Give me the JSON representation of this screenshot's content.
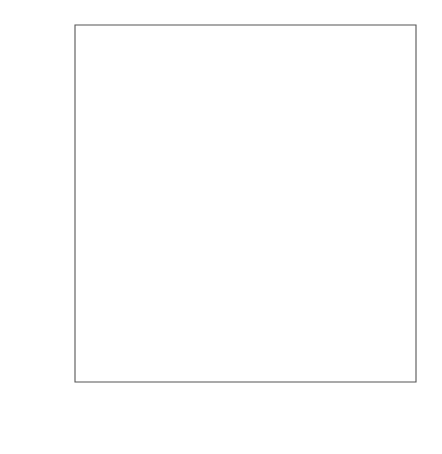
{
  "chart_data": {
    "type": "scatter",
    "title": "",
    "xlabel": "JUDGED PERCENT FOR TRUE = 52.5",
    "ylabel": "JUDGED PERCENT FOR TRUE = 57.5",
    "xlim": [
      26,
      86
    ],
    "ylim": [
      26,
      86
    ],
    "grid": false,
    "legend": null,
    "xticks": [
      30,
      40,
      50,
      60,
      70,
      80
    ],
    "yticks": [
      30,
      40,
      50,
      60,
      70,
      80
    ],
    "xtick_labels": [
      "30",
      "40",
      "50",
      "60",
      "70",
      "80"
    ],
    "ytick_labels": [
      "30",
      "40",
      "50",
      "60",
      "70",
      "80"
    ],
    "xminor_ticks": [
      35,
      45,
      55,
      65,
      75,
      85
    ],
    "yminor_ticks": [
      35,
      45,
      55,
      65,
      75,
      85
    ],
    "marker": "open-circle",
    "marker_radius": 3,
    "reference_line": {
      "name": "y = x identity line",
      "x0": 26,
      "y0": 26,
      "x1": 86,
      "y1": 86
    },
    "points": [
      {
        "x": 30,
        "y": 50
      },
      {
        "x": 30,
        "y": 40
      },
      {
        "x": 40,
        "y": 47
      },
      {
        "x": 40,
        "y": 45
      },
      {
        "x": 40,
        "y": 40
      },
      {
        "x": 43,
        "y": 50
      },
      {
        "x": 43,
        "y": 45
      },
      {
        "x": 45,
        "y": 55
      },
      {
        "x": 45,
        "y": 50
      },
      {
        "x": 45,
        "y": 47
      },
      {
        "x": 45,
        "y": 45
      },
      {
        "x": 48,
        "y": 52
      },
      {
        "x": 48,
        "y": 51
      },
      {
        "x": 48,
        "y": 50
      },
      {
        "x": 49,
        "y": 50
      },
      {
        "x": 50,
        "y": 66
      },
      {
        "x": 50,
        "y": 60
      },
      {
        "x": 50,
        "y": 57
      },
      {
        "x": 50,
        "y": 56
      },
      {
        "x": 50,
        "y": 55
      },
      {
        "x": 50,
        "y": 50
      },
      {
        "x": 50,
        "y": 45
      },
      {
        "x": 51,
        "y": 56
      },
      {
        "x": 51,
        "y": 55
      },
      {
        "x": 51,
        "y": 50
      },
      {
        "x": 52,
        "y": 56
      },
      {
        "x": 52,
        "y": 55
      },
      {
        "x": 52,
        "y": 50
      },
      {
        "x": 53,
        "y": 56
      },
      {
        "x": 53,
        "y": 55
      },
      {
        "x": 53,
        "y": 50
      },
      {
        "x": 54,
        "y": 55
      },
      {
        "x": 55,
        "y": 60
      },
      {
        "x": 55,
        "y": 55
      },
      {
        "x": 55,
        "y": 50
      },
      {
        "x": 57,
        "y": 57
      },
      {
        "x": 58,
        "y": 60
      },
      {
        "x": 59,
        "y": 60
      },
      {
        "x": 60,
        "y": 65
      },
      {
        "x": 60,
        "y": 60
      },
      {
        "x": 60,
        "y": 55
      },
      {
        "x": 60,
        "y": 50
      },
      {
        "x": 65,
        "y": 65
      },
      {
        "x": 65,
        "y": 60
      },
      {
        "x": 65,
        "y": 56
      },
      {
        "x": 67,
        "y": 65
      },
      {
        "x": 68,
        "y": 65
      },
      {
        "x": 70,
        "y": 75
      },
      {
        "x": 70,
        "y": 70
      },
      {
        "x": 75,
        "y": 75
      },
      {
        "x": 75,
        "y": 70
      },
      {
        "x": 75,
        "y": 60
      },
      {
        "x": 80,
        "y": 85
      }
    ]
  }
}
